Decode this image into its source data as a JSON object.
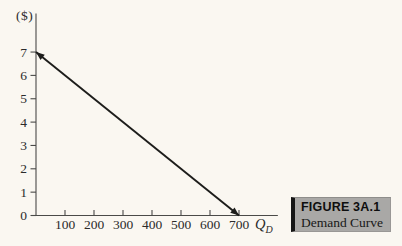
{
  "page": {
    "background_color": "#faf7f1"
  },
  "chart_data": {
    "type": "line",
    "title": "",
    "ylabel": "($)",
    "xlabel_main": "Q",
    "xlabel_sub": "D",
    "y_ticks": [
      0,
      1,
      2,
      3,
      4,
      5,
      6,
      7
    ],
    "x_ticks": [
      100,
      200,
      300,
      400,
      500,
      600,
      700
    ],
    "xlim": [
      0,
      834
    ],
    "ylim": [
      0,
      8.65
    ],
    "grid": false,
    "legend": "none",
    "axis_color": "#4a4a48",
    "tick_label_color": "#2b2b2b",
    "series": [
      {
        "name": "Demand curve",
        "points": [
          {
            "x": 0,
            "y": 7
          },
          {
            "x": 700,
            "y": 0
          }
        ],
        "color": "#1d1d1b",
        "width": 1.9,
        "arrow_start": true,
        "arrow_end": true
      }
    ]
  },
  "figure_label": {
    "number": "FIGURE 3A.1",
    "title": "Demand Curve",
    "background_color": "#a9a8a6",
    "accent_bar_color": "#151515"
  }
}
